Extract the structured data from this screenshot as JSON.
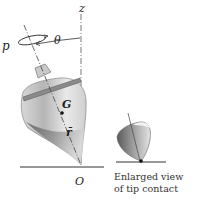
{
  "figure": {
    "labels": {
      "z": "z",
      "theta": "θ",
      "p": "p",
      "G": "G",
      "r": "r̄",
      "O": "O"
    },
    "caption": {
      "line1": "Enlarged view",
      "line2": "of tip contact"
    },
    "colors": {
      "ink": "#222222",
      "top_light": "#e6e6e6",
      "top_dark": "#6e6e6e",
      "rim": "#8a8a8a",
      "ground": "#333333"
    }
  }
}
